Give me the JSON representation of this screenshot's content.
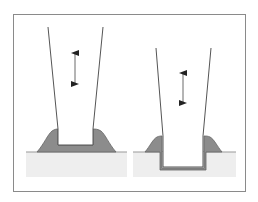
{
  "diagram": {
    "type": "process-comparison",
    "panels": [
      {
        "id": "left",
        "description": "tapered tool pressing onto flat surface, material displaced outward into a raised mound",
        "tool_motion": "vertical-reciprocating",
        "indentation": "shallow"
      },
      {
        "id": "right",
        "description": "tapered tool pressed into surface, forming a rectangular recess with a thin lining and raised lips",
        "tool_motion": "vertical-reciprocating",
        "indentation": "deep"
      }
    ],
    "colors": {
      "frame": "#8a8a8a",
      "tool_outline": "#555555",
      "displaced_material": "#8c8c8c",
      "ground": "#eeeeee",
      "ground_line": "#999999",
      "arrow": "#222222",
      "background": "#ffffff"
    }
  }
}
